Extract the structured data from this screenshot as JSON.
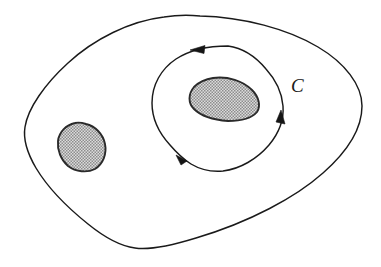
{
  "figure": {
    "background_color": "#ffffff",
    "ink_color": "#1a1a1a",
    "hatch_color": "#6e6e6e",
    "hatch_fill_color": "#d8d8d8"
  },
  "labels": {
    "contour_c": "C"
  },
  "shapes": {
    "outer_boundary": {
      "name": "outer-region-boundary",
      "description": "large irregular closed curve bounding the region",
      "extent": {
        "left": 25,
        "right": 362,
        "top": 16,
        "bottom": 249
      }
    },
    "contour": {
      "name": "contour-c",
      "description": "closed oriented contour encircling the right hole",
      "orientation": "counterclockwise",
      "extent": {
        "left": 152,
        "right": 284,
        "top": 46,
        "bottom": 172
      }
    },
    "hole_left": {
      "name": "hole-left",
      "description": "shaded excluded blob on the left",
      "extent": {
        "left": 58,
        "right": 106,
        "top": 123,
        "bottom": 171
      }
    },
    "hole_right": {
      "name": "hole-right",
      "description": "shaded excluded blob enclosed by contour C",
      "extent": {
        "left": 189,
        "right": 259,
        "top": 77,
        "bottom": 121
      }
    }
  },
  "arrows": [
    {
      "name": "arrow-top",
      "direction": "left",
      "x": 196,
      "y": 50
    },
    {
      "name": "arrow-bottom-left",
      "direction": "down-left",
      "x": 181,
      "y": 158
    },
    {
      "name": "arrow-right",
      "direction": "up",
      "x": 281,
      "y": 117
    }
  ]
}
